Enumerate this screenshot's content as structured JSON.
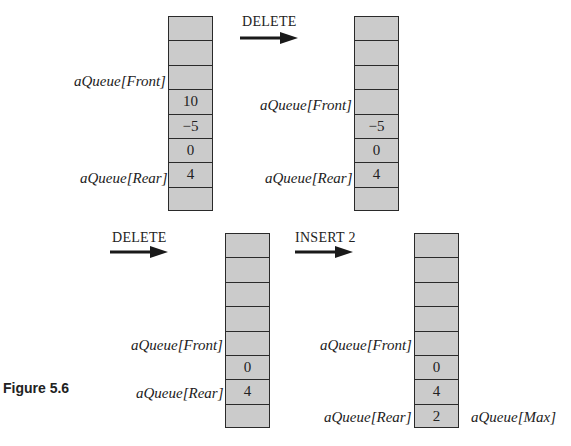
{
  "figure": {
    "caption": "Figure 5.6",
    "operations": [
      {
        "label": "DELETE"
      },
      {
        "label": "DELETE"
      },
      {
        "label": "INSERT 2"
      }
    ],
    "arrays": [
      {
        "cells": [
          "",
          "",
          "",
          "10",
          "−5",
          "0",
          "4",
          ""
        ],
        "front_label": "aQueue[Front]",
        "rear_label": "aQueue[Rear]",
        "front_row": 2,
        "rear_row": 6
      },
      {
        "cells": [
          "",
          "",
          "",
          "",
          "−5",
          "0",
          "4",
          ""
        ],
        "front_label": "aQueue[Front]",
        "rear_label": "aQueue[Rear]",
        "front_row": 3,
        "rear_row": 6
      },
      {
        "cells": [
          "",
          "",
          "",
          "",
          "",
          "0",
          "4",
          ""
        ],
        "front_label": "aQueue[Front]",
        "rear_label": "aQueue[Rear]",
        "front_row": 4,
        "rear_row": 6
      },
      {
        "cells": [
          "",
          "",
          "",
          "",
          "",
          "0",
          "4",
          "2"
        ],
        "front_label": "aQueue[Front]",
        "rear_label": "aQueue[Rear]",
        "max_label": "aQueue[Max]",
        "front_row": 4,
        "rear_row": 7,
        "max_row": 7
      }
    ],
    "colors": {
      "cell_fill": "#cbcbcb",
      "cell_border": "#2a2a2a",
      "arrow": "#1a1a1a"
    }
  }
}
